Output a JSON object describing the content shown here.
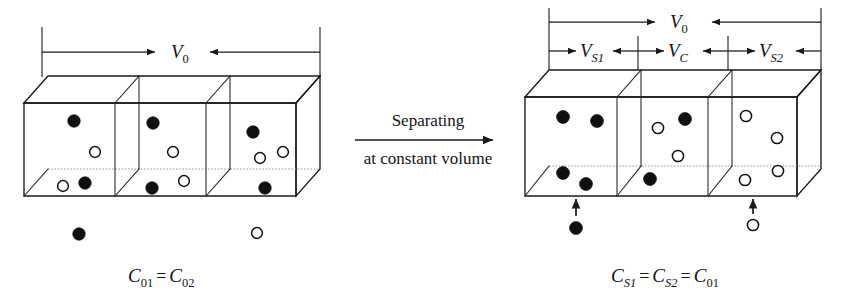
{
  "figure": {
    "type": "schematic-diagram"
  },
  "process": {
    "line1": "Separating",
    "line2": "at constant volume",
    "arrow_direction": "right"
  },
  "left_box": {
    "caption": {
      "c01": "C",
      "c01_sub": "01",
      "equals": "=",
      "c02": "C",
      "c02_sub": "02"
    },
    "dimensions": [
      {
        "name": "V0",
        "symbol": "V",
        "subscript": "0",
        "span": "full-width"
      }
    ],
    "compartments": [
      {
        "name": "compartment-1",
        "particles": [
          {
            "type": "filled",
            "cx": 74,
            "cy": 121,
            "r": 6.2
          },
          {
            "type": "open",
            "cx": 95,
            "cy": 152,
            "r": 5.4
          },
          {
            "type": "open",
            "cx": 63,
            "cy": 186,
            "r": 5.4
          },
          {
            "type": "filled",
            "cx": 85,
            "cy": 183,
            "r": 6.2
          }
        ]
      },
      {
        "name": "compartment-2",
        "particles": [
          {
            "type": "filled",
            "cx": 153,
            "cy": 123,
            "r": 6.2
          },
          {
            "type": "open",
            "cx": 173,
            "cy": 152,
            "r": 5.4
          },
          {
            "type": "filled",
            "cx": 152,
            "cy": 188,
            "r": 6.2
          },
          {
            "type": "open",
            "cx": 184,
            "cy": 181,
            "r": 5.4
          }
        ]
      },
      {
        "name": "compartment-3",
        "particles": [
          {
            "type": "filled",
            "cx": 253,
            "cy": 132,
            "r": 6.2
          },
          {
            "type": "open",
            "cx": 260,
            "cy": 158,
            "r": 5.4
          },
          {
            "type": "open",
            "cx": 283,
            "cy": 152,
            "r": 5.4
          },
          {
            "type": "filled",
            "cx": 265,
            "cy": 188,
            "r": 6.2
          }
        ]
      }
    ],
    "escaped_particles": [
      {
        "type": "filled",
        "cx": 79,
        "cy": 234,
        "r": 6.2
      },
      {
        "type": "open",
        "cx": 257,
        "cy": 233,
        "r": 5.4
      }
    ]
  },
  "right_box": {
    "caption": {
      "cs1": "C",
      "cs1_sub": "S1",
      "equals1": "=",
      "cs2": "C",
      "cs2_sub": "S2",
      "equals2": "=",
      "c01": "C",
      "c01_sub": "01"
    },
    "dimensions": [
      {
        "name": "V0",
        "symbol": "V",
        "subscript": "0",
        "span": "full-width"
      },
      {
        "name": "VS1",
        "symbol": "V",
        "subscript": "S1",
        "span": "compartment-1"
      },
      {
        "name": "VC",
        "symbol": "V",
        "subscript": "C",
        "span": "compartment-2"
      },
      {
        "name": "VS2",
        "symbol": "V",
        "subscript": "S2",
        "span": "compartment-3"
      }
    ],
    "compartments": [
      {
        "name": "compartment-1",
        "particles": [
          {
            "type": "filled",
            "cx": 563,
            "cy": 117,
            "r": 6.4
          },
          {
            "type": "filled",
            "cx": 597,
            "cy": 121,
            "r": 6.4
          },
          {
            "type": "filled",
            "cx": 563,
            "cy": 173,
            "r": 6.4
          },
          {
            "type": "filled",
            "cx": 586,
            "cy": 184,
            "r": 6.4
          }
        ]
      },
      {
        "name": "compartment-2",
        "particles": [
          {
            "type": "open",
            "cx": 658,
            "cy": 128,
            "r": 5.6
          },
          {
            "type": "filled",
            "cx": 685,
            "cy": 119,
            "r": 6.4
          },
          {
            "type": "open",
            "cx": 678,
            "cy": 156,
            "r": 5.6
          },
          {
            "type": "filled",
            "cx": 650,
            "cy": 179,
            "r": 6.4
          }
        ]
      },
      {
        "name": "compartment-3",
        "particles": [
          {
            "type": "open",
            "cx": 746,
            "cy": 116,
            "r": 5.6
          },
          {
            "type": "open",
            "cx": 777,
            "cy": 138,
            "r": 5.6
          },
          {
            "type": "open",
            "cx": 778,
            "cy": 171,
            "r": 5.6
          },
          {
            "type": "open",
            "cx": 745,
            "cy": 180,
            "r": 5.6
          }
        ]
      }
    ],
    "injected_particles": [
      {
        "type": "filled",
        "cx": 576,
        "cy": 228,
        "r": 6.4,
        "target": "compartment-1"
      },
      {
        "type": "open",
        "cx": 753,
        "cy": 225,
        "r": 5.6,
        "target": "compartment-3"
      }
    ]
  },
  "colors": {
    "ink": "#141414",
    "line": "#1a1a1a",
    "dotted_floor": "#9a9a9a",
    "background": "#ffffff"
  }
}
